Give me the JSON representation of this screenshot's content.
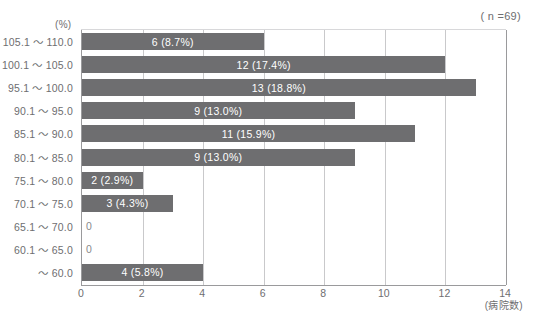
{
  "title": "",
  "annotations": {
    "sample_size": "( n =69)",
    "y_unit": "(%)",
    "x_unit": "(病院数)"
  },
  "chart_data": {
    "type": "bar",
    "orientation": "horizontal",
    "title": "",
    "xlabel": "(病院数)",
    "ylabel": "(%)",
    "xlim": [
      0,
      14
    ],
    "xticks": [
      0,
      2,
      4,
      6,
      8,
      10,
      12,
      14
    ],
    "grid": true,
    "legend": null,
    "sample_size": 69,
    "categories": [
      "105.1 ～ 110.0",
      "100.1 ～ 105.0",
      "95.1 ～ 100.0",
      "90.1 ～ 95.0",
      "85.1 ～ 90.0",
      "80.1 ～ 85.0",
      "75.1 ～ 80.0",
      "70.1 ～ 75.0",
      "65.1 ～ 70.0",
      "60.1 ～ 65.0",
      "～ 60.0"
    ],
    "values": [
      6,
      12,
      13,
      9,
      11,
      9,
      2,
      3,
      0,
      0,
      4
    ],
    "percents": [
      "8.7%",
      "17.4%",
      "18.8%",
      "13.0%",
      "15.9%",
      "13.0%",
      "2.9%",
      "4.3%",
      null,
      null,
      "5.8%"
    ],
    "data_labels": [
      "6 (8.7%)",
      "12 (17.4%)",
      "13 (18.8%)",
      "9 (13.0%)",
      "11 (15.9%)",
      "9 (13.0%)",
      "2 (2.9%)",
      "3 (4.3%)",
      "0",
      "0",
      "4 (5.8%)"
    ],
    "colors": {
      "bar": "#6e6e70",
      "bar_text": "#ffffff",
      "axis": "#9a9a9c",
      "grid": "#c9c9cb",
      "text": "#6e6e70"
    }
  }
}
